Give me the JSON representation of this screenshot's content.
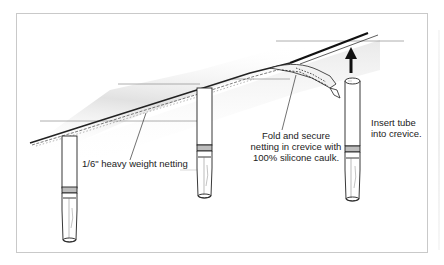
{
  "diagram": {
    "type": "illustration",
    "labels": {
      "netting": "1/6\" heavy weight netting",
      "fold": [
        "Fold and secure",
        "netting in crevice with",
        "100% silicone caulk."
      ],
      "insert": [
        "Insert tube",
        "into crevice."
      ]
    },
    "elements": {
      "tubes": 3,
      "arrow_direction": "up"
    },
    "colors": {
      "frame": "#c9c9c9",
      "line": "#111111",
      "shadow": "#d6d6d6"
    }
  }
}
